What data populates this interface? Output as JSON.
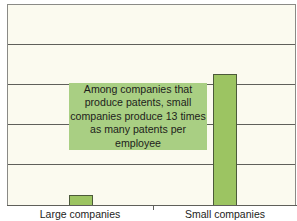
{
  "chart_data": {
    "type": "bar",
    "title": "",
    "xlabel": "",
    "ylabel": "",
    "categories": [
      "Large companies",
      "Small companies"
    ],
    "values": [
      1,
      13
    ],
    "units": "relative patents per employee (unlabeled axis)",
    "ylim": [
      0,
      20
    ],
    "grid": true,
    "gridlines_count": 4,
    "legend": null,
    "annotation": {
      "lines": [
        "Among companies that",
        "produce patents, small",
        "companies produce 13 times",
        "as many patents per employee"
      ]
    },
    "colors": {
      "bar": "#9cc462",
      "bar_border": "#4c5a3a",
      "annotation_bg": "#a9cf83",
      "plot_bg": "#fbfaef"
    }
  }
}
